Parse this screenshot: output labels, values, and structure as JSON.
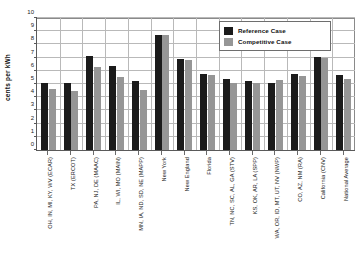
{
  "chart_data": {
    "type": "bar",
    "title": "",
    "xlabel": "",
    "ylabel": "cents per kWh",
    "ylim": [
      0,
      10
    ],
    "ystep": 1,
    "grid": true,
    "legend_position": "top-right",
    "ytick_labels": [
      "0",
      "1",
      "2",
      "3",
      "4",
      "5",
      "6",
      "7",
      "8",
      "9",
      "10"
    ],
    "categories": [
      "OH, IN, MI, KY, WV (ECAR)",
      "TX (ERCOT)",
      "PA, NJ, DE (MAAC)",
      "IL, WI, MO (MAIN)",
      "MN, IA, ND, SD, NE (MAPP)",
      "New York",
      "New England",
      "Florida",
      "TN, NC, SC, AL, GA (STV)",
      "KS, OK, AR, LA (SPP)",
      "WA, OR, ID, MT, UT, NV (NWP)",
      "CO, AZ, NM (RA)",
      "California (CNV)",
      "National Average"
    ],
    "series": [
      {
        "name": "Reference Case",
        "color": "#1b1b1b",
        "values": [
          5.1,
          5.1,
          7.15,
          6.4,
          5.2,
          8.75,
          6.9,
          5.75,
          5.35,
          5.25,
          5.1,
          5.75,
          7.05,
          5.7
        ]
      },
      {
        "name": "Competitive Case",
        "color": "#969696",
        "values": [
          4.65,
          4.45,
          6.3,
          5.55,
          4.55,
          8.7,
          6.85,
          5.7,
          5.1,
          5.1,
          5.3,
          5.6,
          6.95,
          5.4
        ]
      }
    ]
  },
  "legend": {
    "items": [
      {
        "label": "Reference Case",
        "swatch": "ref"
      },
      {
        "label": "Competitive Case",
        "swatch": "comp"
      }
    ]
  }
}
